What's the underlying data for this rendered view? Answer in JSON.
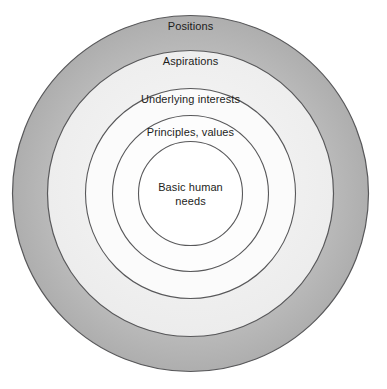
{
  "diagram": {
    "type": "concentric-circles",
    "center": {
      "x": 190.5,
      "y": 193.5
    },
    "background_color": "#ffffff",
    "stroke_color": "#58585a",
    "text_color": "#1d1d1b",
    "rings": [
      {
        "id": "positions",
        "label": "Positions",
        "level": 1,
        "radius": 178,
        "fill": "#b9b9b9",
        "label_x": 190.5,
        "label_y": 20
      },
      {
        "id": "aspirations",
        "label": "Aspirations",
        "level": 2,
        "radius": 143,
        "fill": "#f2f2f2",
        "label_x": 190.5,
        "label_y": 55
      },
      {
        "id": "underlying-interests",
        "label": "Underlying interests",
        "level": 3,
        "radius": 105,
        "fill": "#fbfbfb",
        "label_x": 190.5,
        "label_y": 93
      },
      {
        "id": "principles-values",
        "label": "Principles, values",
        "level": 4,
        "radius": 78,
        "fill": "#fdfdfd",
        "label_x": 190.5,
        "label_y": 126
      },
      {
        "id": "basic-human-needs",
        "label": "Basic human\nneeds",
        "level": 5,
        "radius": 52,
        "fill": "#ffffff",
        "label_x": 190.5,
        "label_y": 180
      }
    ]
  }
}
